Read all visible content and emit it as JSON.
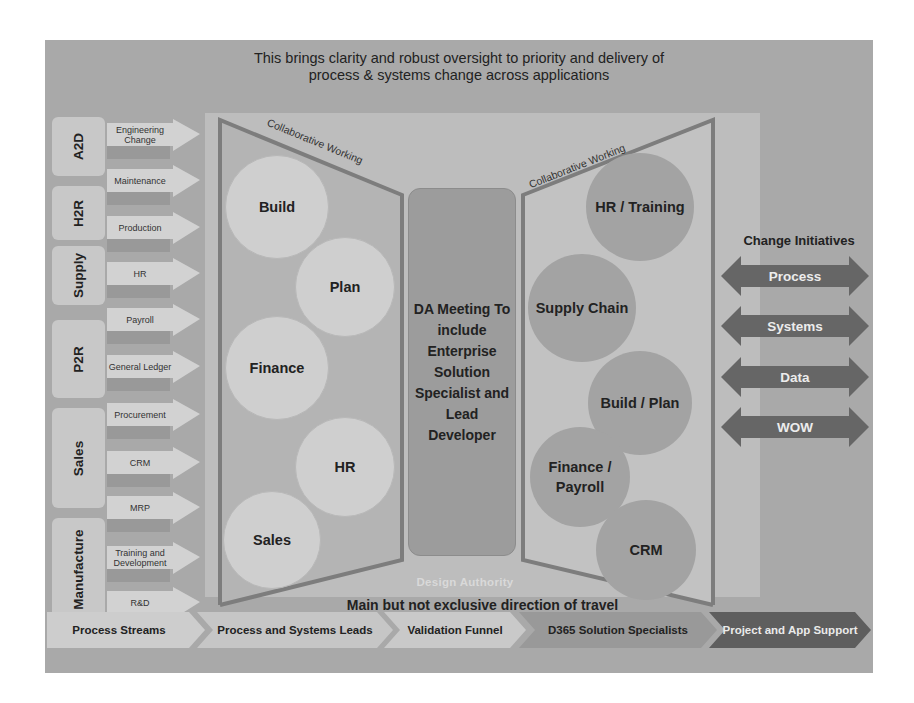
{
  "headline": {
    "line1": "This brings clarity and robust oversight to priority and delivery of",
    "line2": "process & systems change across applications"
  },
  "process_groups": [
    {
      "label": "A2D"
    },
    {
      "label": "H2R"
    },
    {
      "label": "Supply"
    },
    {
      "label": "P2R"
    },
    {
      "label": "Sales"
    },
    {
      "label": "Manufacture"
    }
  ],
  "process_streams": [
    {
      "label": "Engineering Change"
    },
    {
      "label": "Maintenance"
    },
    {
      "label": "Production"
    },
    {
      "label": "HR"
    },
    {
      "label": "Payroll"
    },
    {
      "label": "General Ledger"
    },
    {
      "label": "Procurement"
    },
    {
      "label": "CRM"
    },
    {
      "label": "MRP"
    },
    {
      "label": "Training and Development"
    },
    {
      "label": "R&D"
    }
  ],
  "left_funnel": {
    "edge_label": "Collaborative Working",
    "circles": [
      {
        "label": "Build"
      },
      {
        "label": "Plan"
      },
      {
        "label": "Finance"
      },
      {
        "label": "HR"
      },
      {
        "label": "Sales"
      }
    ]
  },
  "da_meeting": {
    "text": "DA Meeting To include Enterprise Solution Specialist and Lead Developer"
  },
  "right_funnel": {
    "edge_label": "Collaborative Working",
    "circles": [
      {
        "label": "HR / Training"
      },
      {
        "label": "Supply Chain"
      },
      {
        "label": "Build / Plan"
      },
      {
        "label": "Finance / Payroll"
      },
      {
        "label": "CRM"
      }
    ]
  },
  "design_authority_label": "Design Authority",
  "direction_label": "Main but not exclusive direction of travel",
  "change_initiatives": {
    "title": "Change Initiatives",
    "items": [
      {
        "label": "Process"
      },
      {
        "label": "Systems"
      },
      {
        "label": "Data"
      },
      {
        "label": "WOW"
      }
    ]
  },
  "stages": [
    {
      "label": "Process Streams"
    },
    {
      "label": "Process and Systems Leads"
    },
    {
      "label": "Validation Funnel"
    },
    {
      "label": "D365 Solution Specialists"
    },
    {
      "label": "Project and App Support"
    }
  ],
  "colors": {
    "background": "#a9a9a9",
    "inner_panel": "#bdbdbd",
    "light_circle": "#cfcfcf",
    "dark_circle": "#a3a3a3",
    "funnel_edge": "#7d7d7d",
    "initiative_arrow": "#666666",
    "stage_dark": "#5e5e5e"
  }
}
